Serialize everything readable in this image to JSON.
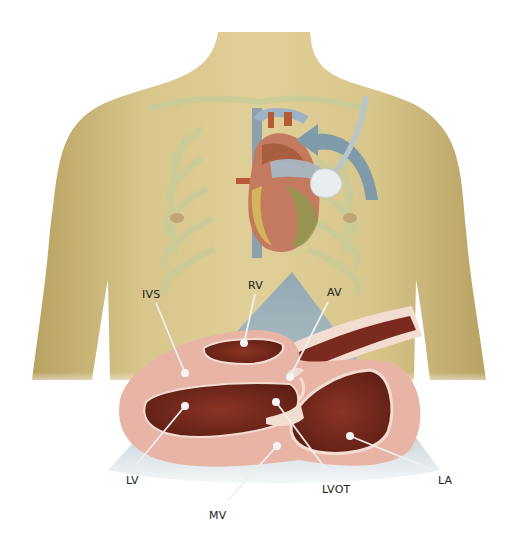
{
  "diagram": {
    "colors": {
      "skin": "#d9c48a",
      "skin_shadow": "#b9a462",
      "ribs": "#c9cf9a",
      "probe_arrow": "#7f9aa8",
      "ultrasound_sector": "#a9bcc6",
      "myocardium": "#e8b4a6",
      "blood_cavity": "#7a2a1e",
      "valve_tissue": "#f3ddd0",
      "pointer_line": "#eeeeee"
    },
    "labels": {
      "ivs": "IVS",
      "rv": "RV",
      "av": "AV",
      "lv": "LV",
      "mv": "MV",
      "lvot": "LVOT",
      "la": "LA"
    },
    "label_meanings": {
      "ivs": "Interventricular septum",
      "rv": "Right ventricle",
      "av": "Aortic valve",
      "lv": "Left ventricle",
      "mv": "Mitral valve",
      "lvot": "Left ventricular outflow tract",
      "la": "Left atrium"
    }
  }
}
